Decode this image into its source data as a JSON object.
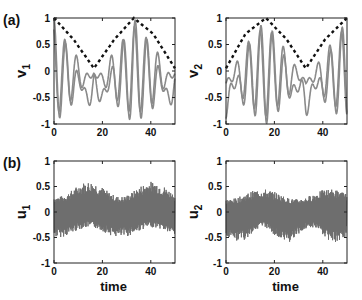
{
  "chart_data": [
    {
      "type": "line",
      "panel_label": "(a)",
      "ylabel": "v_1",
      "ylabel_main": "v",
      "ylabel_sub": "1",
      "xlabel": "",
      "xlim": [
        0,
        50
      ],
      "ylim": [
        -1,
        1
      ],
      "xticks": [
        "0",
        "20",
        "40"
      ],
      "yticks": [
        "1",
        "0.5",
        "0",
        "-0.5",
        "-1"
      ],
      "series": [
        {
          "name": "oscillation (gray)",
          "style": "solid gray",
          "description": "oscillating signal between -1 and 1, amplitude modulated"
        },
        {
          "name": "envelope (dashed)",
          "style": "dashed black",
          "x": [
            0,
            8,
            16.5,
            25,
            33,
            41,
            50
          ],
          "y": [
            1,
            0.6,
            0.05,
            0.6,
            1,
            0.7,
            0.05
          ]
        }
      ]
    },
    {
      "type": "line",
      "panel_label": "",
      "ylabel": "v_2",
      "ylabel_main": "v",
      "ylabel_sub": "2",
      "xlabel": "",
      "xlim": [
        0,
        50
      ],
      "ylim": [
        -1,
        1
      ],
      "xticks": [
        "0",
        "20",
        "40"
      ],
      "yticks": [
        "1",
        "0.5",
        "0",
        "-0.5",
        "-1"
      ],
      "series": [
        {
          "name": "oscillation (gray)",
          "style": "solid gray",
          "description": "oscillating signal between -1 and 1, amplitude modulated"
        },
        {
          "name": "envelope (dashed)",
          "style": "dashed black",
          "x": [
            0,
            8,
            16.5,
            25,
            33,
            41,
            50
          ],
          "y": [
            0.05,
            0.7,
            1,
            0.6,
            0.05,
            0.6,
            1
          ]
        }
      ]
    },
    {
      "type": "line",
      "panel_label": "(b)",
      "ylabel": "u_1",
      "ylabel_main": "u",
      "ylabel_sub": "1",
      "xlabel": "time",
      "xlim": [
        0,
        50
      ],
      "ylim": [
        -1,
        1
      ],
      "xticks": [
        "0",
        "20",
        "40"
      ],
      "yticks": [
        "1",
        "0.5",
        "0",
        "-0.5",
        "-1"
      ],
      "series": [
        {
          "name": "u1",
          "style": "dense gray",
          "description": "fast oscillation, upper envelope ~0.35-0.65, lower envelope ~-0.5 to -0.3, bump near t=20 and t=45"
        }
      ]
    },
    {
      "type": "line",
      "panel_label": "",
      "ylabel": "u_2",
      "ylabel_main": "u",
      "ylabel_sub": "2",
      "xlabel": "time",
      "xlim": [
        0,
        50
      ],
      "ylim": [
        -1,
        1
      ],
      "xticks": [
        "0",
        "20",
        "40"
      ],
      "yticks": [
        "1",
        "0.5",
        "0",
        "-0.5",
        "-1"
      ],
      "series": [
        {
          "name": "u2",
          "style": "dense gray",
          "description": "fast oscillation, upper envelope ~0.3-0.5, lower envelope ~-0.65 to -0.3, dip near t=30"
        }
      ]
    }
  ]
}
